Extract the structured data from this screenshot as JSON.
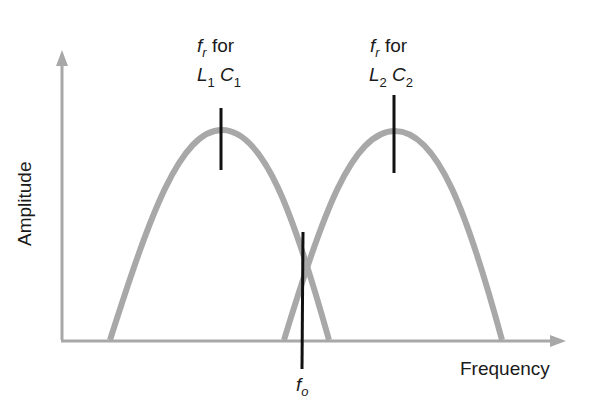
{
  "figure": {
    "y_axis_label": "Amplitude",
    "x_axis_label": "Frequency",
    "left_peak_label": {
      "line1_var": "f",
      "line1_sub": "r",
      "line1_text": "for",
      "line2_L": "L",
      "line2_L_sub": "1",
      "line2_C": "C",
      "line2_C_sub": "1"
    },
    "right_peak_label": {
      "line1_var": "f",
      "line1_sub": "r",
      "line1_text": "for",
      "line2_L": "L",
      "line2_L_sub": "2",
      "line2_C": "C",
      "line2_C_sub": "2"
    },
    "fo_label": {
      "var": "f",
      "sub": "o"
    },
    "colors": {
      "curve": "#a8a8a8",
      "axis": "#a8a8a8",
      "marker": "#111111",
      "text": "#1a1a1a"
    }
  }
}
